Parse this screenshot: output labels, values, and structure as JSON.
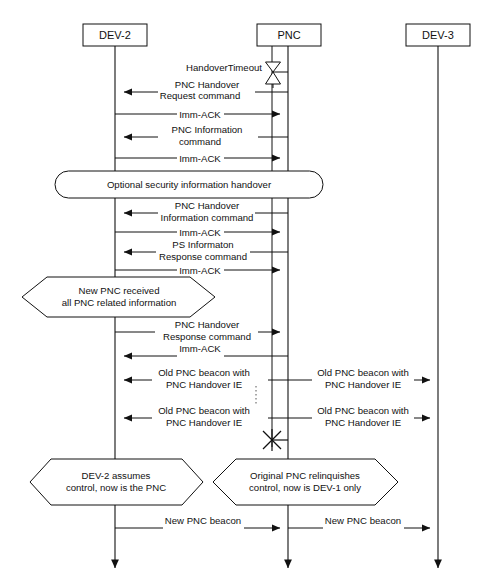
{
  "diagram": {
    "type": "sequence-diagram",
    "background_color": "#ffffff",
    "line_color": "#111111"
  },
  "lifelines": [
    {
      "id": "dev2",
      "label": "DEV-2",
      "x": 115,
      "box_x": 83,
      "box_y": 24,
      "box_w": 64,
      "box_h": 22
    },
    {
      "id": "pnc",
      "label": "PNC",
      "x": 288,
      "box_x": 257,
      "box_y": 24,
      "box_w": 64,
      "box_h": 22
    },
    {
      "id": "dev3",
      "label": "DEV-3",
      "x": 438,
      "box_x": 406,
      "box_y": 24,
      "box_w": 64,
      "box_h": 22
    }
  ],
  "timer": {
    "label": "HandoverTimeout",
    "symbol": "hourglass-timer"
  },
  "messages": [
    {
      "id": "m1",
      "lines": [
        "PNC Handover",
        "Request command"
      ],
      "from": "pnc",
      "to": "dev2",
      "direction": "left",
      "y": 91
    },
    {
      "id": "m2",
      "lines": [
        "Imm-ACK"
      ],
      "from": "dev2",
      "to": "pnc",
      "direction": "right",
      "y": 115
    },
    {
      "id": "m3",
      "lines": [
        "PNC Information",
        "command"
      ],
      "from": "pnc",
      "to": "dev2",
      "direction": "left",
      "y": 135
    },
    {
      "id": "m4",
      "lines": [
        "Imm-ACK"
      ],
      "from": "dev2",
      "to": "pnc",
      "direction": "right",
      "y": 159
    },
    {
      "id": "m5",
      "lines": [
        "PNC Handover",
        "Information command"
      ],
      "from": "pnc",
      "to": "dev2",
      "direction": "left",
      "y": 212
    },
    {
      "id": "m6",
      "lines": [
        "Imm-ACK"
      ],
      "from": "dev2",
      "to": "pnc",
      "direction": "right",
      "y": 232
    },
    {
      "id": "m7",
      "lines": [
        "PS Informaton",
        "Response command"
      ],
      "from": "pnc",
      "to": "dev2",
      "direction": "left",
      "y": 250
    },
    {
      "id": "m8",
      "lines": [
        "Imm-ACK"
      ],
      "from": "dev2",
      "to": "pnc",
      "direction": "right",
      "y": 270
    },
    {
      "id": "m9",
      "lines": [
        "PNC Handover",
        "Response command"
      ],
      "from": "dev2",
      "to": "pnc",
      "direction": "right",
      "y": 330
    },
    {
      "id": "m10",
      "lines": [
        "Imm-ACK"
      ],
      "from": "pnc",
      "to": "dev2",
      "direction": "left",
      "y": 352
    },
    {
      "id": "m11",
      "lines": [
        "Old PNC beacon with",
        "PNC Handover IE"
      ],
      "from": "pnc",
      "to": "dev2",
      "direction": "left",
      "y": 376
    },
    {
      "id": "m12",
      "lines": [
        "Old PNC beacon with",
        "PNC Handover IE"
      ],
      "from": "pnc",
      "to": "dev3",
      "direction": "right",
      "y": 376
    },
    {
      "id": "m13",
      "lines": [
        "Old PNC beacon with",
        "PNC Handover IE"
      ],
      "from": "pnc",
      "to": "dev2",
      "direction": "left",
      "y": 413
    },
    {
      "id": "m14",
      "lines": [
        "Old PNC beacon with",
        "PNC Handover IE"
      ],
      "from": "pnc",
      "to": "dev3",
      "direction": "right",
      "y": 413
    },
    {
      "id": "m15",
      "lines": [
        "New PNC beacon"
      ],
      "from": "dev2",
      "to": "pnc",
      "direction": "right",
      "y": 524
    },
    {
      "id": "m16",
      "lines": [
        "New PNC beacon"
      ],
      "from": "pnc",
      "to": "dev3",
      "direction": "right",
      "y": 524
    }
  ],
  "notes": [
    {
      "id": "n1",
      "shape": "rounded-rect",
      "lines": [
        "Optional security information handover"
      ],
      "x": 55,
      "y": 171,
      "w": 268,
      "h": 27
    },
    {
      "id": "n2",
      "shape": "hexagon",
      "lines": [
        "New PNC received",
        "all PNC related information"
      ],
      "x": 22,
      "y": 277,
      "w": 193,
      "h": 40
    },
    {
      "id": "n3",
      "shape": "hexagon",
      "lines": [
        "DEV-2 assumes",
        "control, now is the PNC"
      ],
      "x": 30,
      "y": 459,
      "w": 173,
      "h": 46
    },
    {
      "id": "n4",
      "shape": "hexagon",
      "lines": [
        "Original PNC relinquishes",
        "control, now is DEV-1 only"
      ],
      "x": 213,
      "y": 459,
      "w": 185,
      "h": 46
    }
  ],
  "termination": {
    "symbol": "x-cross-destroy",
    "x": 272,
    "y": 440,
    "size": 11
  },
  "continuation": {
    "symbol": "vertical-dotted-ellipsis",
    "x": 256,
    "y_start": 386,
    "y_end": 404
  },
  "activation_bar": {
    "x": 272,
    "y_start": 46,
    "y_end": 447,
    "description": "secondary PNC activation line"
  }
}
